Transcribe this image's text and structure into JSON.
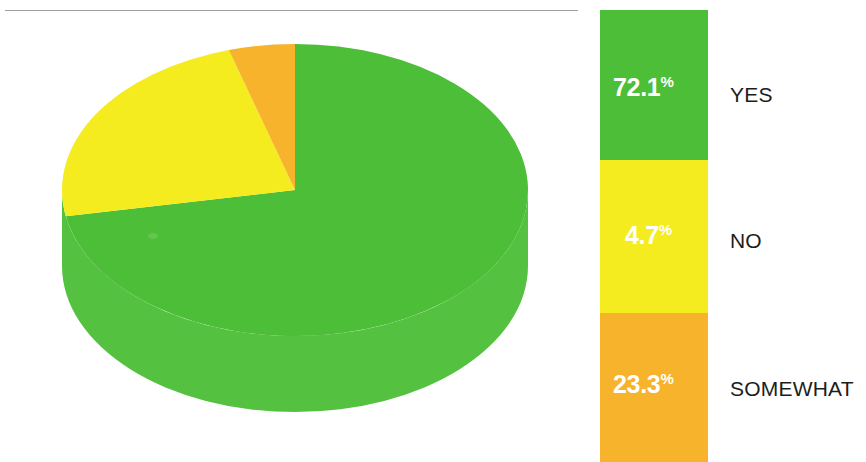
{
  "chart_data": {
    "type": "pie",
    "title": "",
    "subtitle": "",
    "xlabel": "",
    "ylabel": "",
    "categories": [
      "YES",
      "NO",
      "SOMEWHAT"
    ],
    "values": [
      72.1,
      4.7,
      23.3
    ],
    "value_labels": [
      "72.1%",
      "4.7%",
      "23.3%"
    ],
    "units": "percent",
    "legend_position": "right",
    "grid": false,
    "three_d": true,
    "colors": [
      "#4cbe38",
      "#f5ec20",
      "#f7b32b"
    ],
    "series": [
      {
        "name": "Response share",
        "values": [
          72.1,
          4.7,
          23.3
        ]
      }
    ],
    "slices": [
      {
        "label": "YES",
        "value": 72.1,
        "display": "72.1",
        "suffix": "%",
        "color": "#4cbe38",
        "text_color": "#ffffff"
      },
      {
        "label": "NO",
        "value": 4.7,
        "display": "4.7",
        "suffix": "%",
        "color": "#f5ec20",
        "text_color": "#ffffff"
      },
      {
        "label": "SOMEWHAT",
        "value": 23.3,
        "display": "23.3",
        "suffix": "%",
        "color": "#f7b32b",
        "text_color": "#ffffff"
      }
    ],
    "pie_geometry": {
      "center_x": 295,
      "center_y": 190,
      "radius_x": 233,
      "radius_y": 146,
      "depth": 76,
      "start_angle_deg": 0,
      "wedges": [
        {
          "label": "YES",
          "color": "#4cbe38",
          "sweep_deg": 259.6
        },
        {
          "label": "SOMEWHAT",
          "color": "#f5ec20",
          "sweep_deg": 83.9
        },
        {
          "label": "NO",
          "color": "#f7b32b",
          "sweep_deg": 16.5
        }
      ]
    }
  },
  "legend": {
    "bands": [
      {
        "name": "yes",
        "percent": "72.1",
        "percent_suffix": "%",
        "label": "YES",
        "color": "#4cbe38"
      },
      {
        "name": "no",
        "percent": "4.7",
        "percent_suffix": "%",
        "label": "NO",
        "color": "#f5ec20"
      },
      {
        "name": "somewhat",
        "percent": "23.3",
        "percent_suffix": "%",
        "label": "SOMEWHAT",
        "color": "#f7b32b"
      }
    ]
  },
  "decor": {
    "rule_color": "#8d8d93"
  },
  "palette": {
    "green": "#4cbe38",
    "green_side": "#5bc345",
    "green_dark": "#43ac31",
    "yellow": "#f5ec20",
    "orange": "#f7b32b",
    "white": "#ffffff",
    "text": "#1d1d1b",
    "background": "#ffffff"
  }
}
